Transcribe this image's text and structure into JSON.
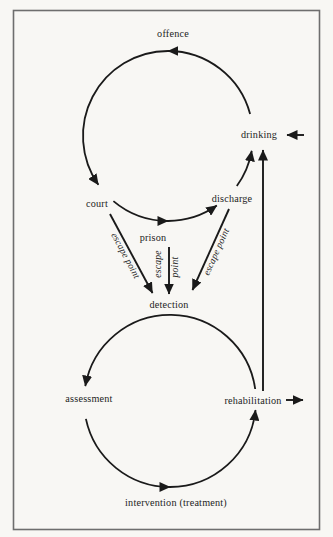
{
  "canvas": {
    "background": "#f8f7f4",
    "ink": "#1a1a1a",
    "frame_color": "#6e6e6e"
  },
  "nodes": {
    "offence": "offence",
    "court": "court",
    "prison": "prison",
    "discharge": "discharge",
    "drinking": "drinking",
    "detection": "detection",
    "assessment": "assessment",
    "intervention": "intervention (treatment)",
    "rehabilitation": "rehabilitation"
  },
  "escape": {
    "court_line": "escape point",
    "prison_word1": "escape",
    "prison_word2": "point",
    "discharge_line": "escape point"
  },
  "cycles": [
    {
      "name": "offending-cycle",
      "direction": "counterclockwise",
      "sequence": [
        "offence",
        "court",
        "prison",
        "discharge",
        "drinking",
        "offence"
      ]
    },
    {
      "name": "treatment-cycle",
      "direction": "counterclockwise",
      "sequence": [
        "detection",
        "assessment",
        "intervention (treatment)",
        "rehabilitation"
      ]
    }
  ],
  "arrows": [
    {
      "from": "drinking",
      "to": "offence",
      "type": "cycle-arc"
    },
    {
      "from": "offence",
      "to": "court",
      "type": "cycle-arc"
    },
    {
      "from": "court",
      "to": "prison",
      "type": "cycle-arc"
    },
    {
      "from": "prison",
      "to": "discharge",
      "type": "cycle-arc"
    },
    {
      "from": "discharge",
      "to": "drinking",
      "type": "cycle-arc"
    },
    {
      "from": "court",
      "to": "detection",
      "type": "escape-point"
    },
    {
      "from": "prison",
      "to": "detection",
      "type": "escape-point"
    },
    {
      "from": "discharge",
      "to": "detection",
      "type": "escape-point"
    },
    {
      "from": "detection",
      "to": "assessment",
      "type": "cycle-arc"
    },
    {
      "from": "assessment",
      "to": "intervention (treatment)",
      "type": "cycle-arc"
    },
    {
      "from": "intervention (treatment)",
      "to": "rehabilitation",
      "type": "cycle-arc"
    },
    {
      "from": "rehabilitation",
      "to": "drinking",
      "type": "straight-line"
    },
    {
      "from": "outside-right",
      "to": "drinking",
      "type": "external-inflow"
    },
    {
      "from": "rehabilitation",
      "to": "outside-right",
      "type": "external-outflow"
    }
  ]
}
